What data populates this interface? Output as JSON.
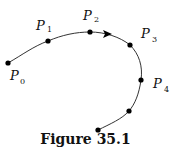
{
  "figure": {
    "caption": "Figure 35.1",
    "curve_color": "#333333",
    "point_color": "#000000",
    "points": [
      {
        "label": "P",
        "subscript": "0",
        "x": 8,
        "y": 63
      },
      {
        "label": "P",
        "subscript": "1",
        "x": 48,
        "y": 41
      },
      {
        "label": "P",
        "subscript": "2",
        "x": 90,
        "y": 32
      },
      {
        "label": "P",
        "subscript": "3",
        "x": 130,
        "y": 45
      },
      {
        "label": "P",
        "subscript": "4",
        "x": 141,
        "y": 80
      }
    ],
    "unlabeled_points": [
      {
        "x": 129,
        "y": 111
      },
      {
        "x": 98,
        "y": 130
      }
    ],
    "direction_arrow": {
      "x": 108,
      "y": 34,
      "direction": "right"
    }
  }
}
